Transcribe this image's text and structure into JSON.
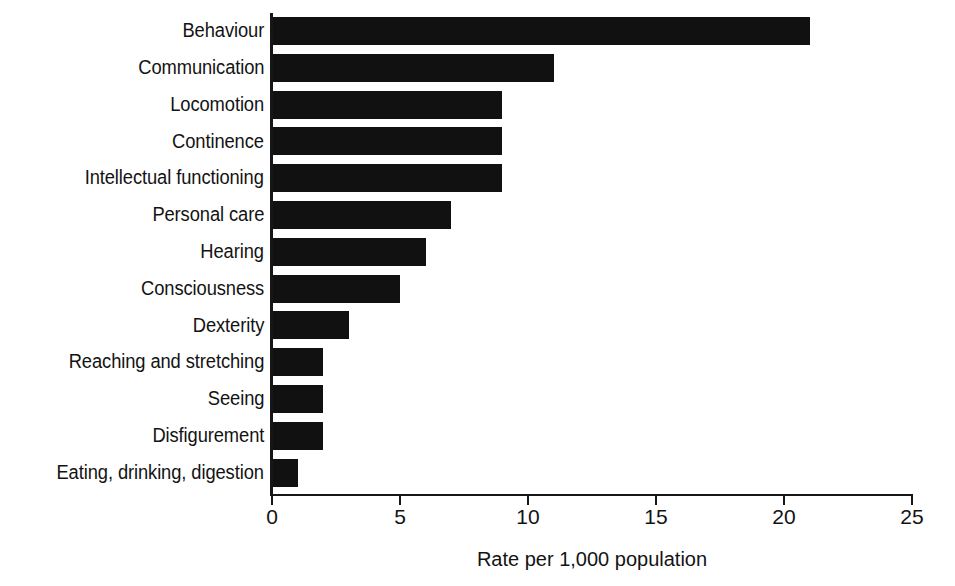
{
  "chart_data": {
    "type": "bar",
    "orientation": "horizontal",
    "title": "",
    "xlabel": "Rate per 1,000 population",
    "ylabel": "",
    "xlim": [
      0,
      25
    ],
    "xticks": [
      "0",
      "5",
      "10",
      "15",
      "20",
      "25"
    ],
    "xtick_values": [
      0,
      5,
      10,
      15,
      20,
      25
    ],
    "grid": false,
    "legend": null,
    "bar_color": "#111111",
    "background_color": "#ffffff",
    "categories": [
      "Behaviour",
      "Communication",
      "Locomotion",
      "Continence",
      "Intellectual functioning",
      "Personal care",
      "Hearing",
      "Consciousness",
      "Dexterity",
      "Reaching and stretching",
      "Seeing",
      "Disfigurement",
      "Eating, drinking, digestion"
    ],
    "values": [
      21,
      11,
      9,
      9,
      9,
      7,
      6,
      5,
      3,
      2,
      2,
      2,
      1
    ],
    "series": [
      {
        "name": "Rate per 1,000 population",
        "values": [
          21,
          11,
          9,
          9,
          9,
          7,
          6,
          5,
          3,
          2,
          2,
          2,
          1
        ]
      }
    ]
  }
}
